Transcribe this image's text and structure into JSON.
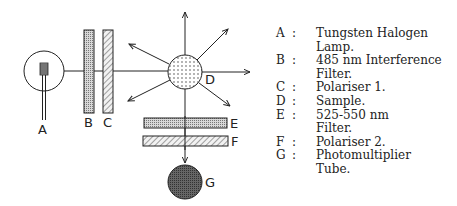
{
  "diagram": {
    "labels": {
      "A": "A",
      "B": "B",
      "C": "C",
      "D": "D",
      "E": "E",
      "F": "F",
      "G": "G"
    },
    "components": [
      {
        "key": "A",
        "shape": "circle-with-lamp-icon"
      },
      {
        "key": "B",
        "shape": "vertical-filter-bar"
      },
      {
        "key": "C",
        "shape": "vertical-polariser-bar"
      },
      {
        "key": "D",
        "shape": "dotted-sample-circle"
      },
      {
        "key": "E",
        "shape": "horizontal-filter-bar"
      },
      {
        "key": "F",
        "shape": "horizontal-polariser-bar"
      },
      {
        "key": "G",
        "shape": "dark-detector-circle"
      }
    ]
  },
  "legend": [
    {
      "key": "A",
      "sep": ":",
      "lines": [
        "Tungsten Halogen",
        "Lamp."
      ]
    },
    {
      "key": "B",
      "sep": ":",
      "lines": [
        "485 nm Interference",
        "Filter."
      ]
    },
    {
      "key": "C",
      "sep": ":",
      "lines": [
        "Polariser 1."
      ]
    },
    {
      "key": "D",
      "sep": ":",
      "lines": [
        "Sample."
      ]
    },
    {
      "key": "E",
      "sep": ":",
      "lines": [
        "525-550 nm",
        "Filter."
      ]
    },
    {
      "key": "F",
      "sep": ":",
      "lines": [
        "Polariser 2."
      ]
    },
    {
      "key": "G",
      "sep": ":",
      "lines": [
        "Photomultiplier",
        "Tube."
      ]
    }
  ],
  "colors": {
    "stroke": "#222222",
    "detector_fill": "#555555"
  }
}
